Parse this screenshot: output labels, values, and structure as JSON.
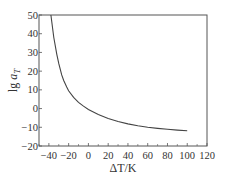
{
  "chart_data": {
    "type": "line",
    "title": "",
    "xlabel": "ΔT/K",
    "ylabel": "lg a_T",
    "xlim": [
      -50,
      120
    ],
    "ylim": [
      -20,
      50
    ],
    "xticks": [
      -40,
      -20,
      0,
      20,
      40,
      60,
      80,
      100,
      120
    ],
    "yticks": [
      -20,
      -10,
      0,
      10,
      20,
      30,
      40,
      50
    ],
    "grid": false,
    "legend": null,
    "series": [
      {
        "name": "lg a_T",
        "x": [
          -38,
          -35,
          -32,
          -30,
          -27,
          -25,
          -22,
          -20,
          -15,
          -10,
          -5,
          0,
          10,
          20,
          30,
          40,
          50,
          60,
          70,
          80,
          90,
          100
        ],
        "values": [
          50,
          38,
          29,
          24,
          18,
          15,
          11.5,
          9.5,
          6,
          3.3,
          1.3,
          -0.5,
          -3.2,
          -5.3,
          -6.9,
          -8.2,
          -9.2,
          -10,
          -10.6,
          -11.1,
          -11.5,
          -11.8
        ]
      }
    ]
  }
}
